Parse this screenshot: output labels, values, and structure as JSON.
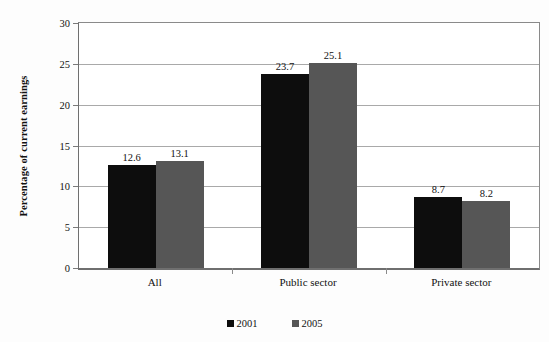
{
  "chart_data": {
    "type": "bar",
    "title": "",
    "subtitle": "",
    "xlabel": "",
    "ylabel": "Percentage of current earnings",
    "categories": [
      "All",
      "Public sector",
      "Private sector"
    ],
    "series": [
      {
        "name": "2001",
        "color": "#0d0d0d",
        "values": [
          12.6,
          23.7,
          8.7
        ]
      },
      {
        "name": "2005",
        "color": "#565656",
        "values": [
          13.1,
          25.1,
          8.2
        ]
      }
    ],
    "ylim": [
      0,
      30
    ],
    "ytick_labels": [
      "0",
      "5",
      "10",
      "15",
      "20",
      "25",
      "30"
    ],
    "ytick_values": [
      0,
      5,
      10,
      15,
      20,
      25,
      30
    ],
    "grid": true,
    "legend_position": "bottom",
    "data_labels": [
      "12.6",
      "13.1",
      "23.7",
      "25.1",
      "8.7",
      "8.2"
    ],
    "axis_color": "#6f6f6f",
    "gridline_color": "#a9a9a9",
    "background_color": "#ffffff"
  }
}
